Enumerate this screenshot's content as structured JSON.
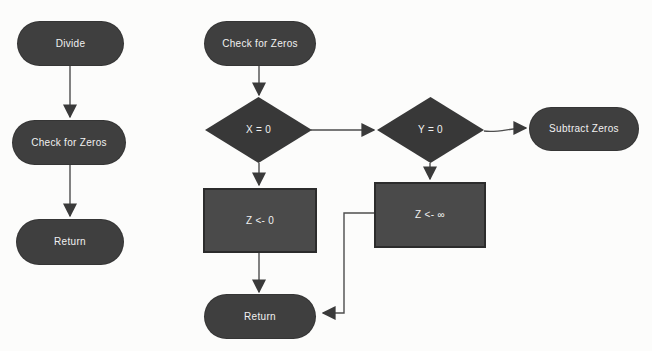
{
  "diagram": {
    "kind": "flowchart",
    "colors": {
      "background": "#fcfcfb",
      "shape_fill": "#3f3f3f",
      "diamond_fill": "#383838",
      "process_fill": "#4a4a4a",
      "process_border": "#2c2c2c",
      "connector": "#4d4d4d",
      "text": "#f1f1f1"
    },
    "left_flow": {
      "divide": "Divide",
      "check_for_zeros": "Check for Zeros",
      "return": "Return"
    },
    "main_flow": {
      "check_for_zeros": "Check for Zeros",
      "decision_x": "X = 0",
      "decision_y": "Y = 0",
      "assign_zero": "Z <- 0",
      "assign_infinity": "Z <- ∞",
      "subtract_zeros": "Subtract Zeros",
      "return": "Return"
    },
    "connections": [
      {
        "from": "divide",
        "to": "check-for-zeros-left"
      },
      {
        "from": "check-for-zeros-left",
        "to": "return-left"
      },
      {
        "from": "check-for-zeros-main",
        "to": "decision-x"
      },
      {
        "from": "decision-x",
        "to": "decision-y"
      },
      {
        "from": "decision-x",
        "to": "assign-zero"
      },
      {
        "from": "decision-y",
        "to": "assign-infinity"
      },
      {
        "from": "decision-y",
        "to": "subtract-zeros"
      },
      {
        "from": "assign-zero",
        "to": "return-main"
      },
      {
        "from": "assign-infinity",
        "to": "return-main"
      }
    ]
  }
}
